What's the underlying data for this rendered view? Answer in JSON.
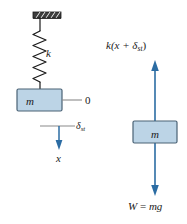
{
  "figure": {
    "type": "physics-free-body-diagram",
    "colors": {
      "block_fill": "#bcd4e6",
      "block_stroke": "#4a6275",
      "arrow_blue": "#2b6ca3",
      "line_black": "#1a1a1a",
      "ceiling_dark": "#3d3d3d",
      "reference_line_gray": "#8a8a8a",
      "background": "#ffffff"
    }
  },
  "left_diagram": {
    "name": "spring-mass-system",
    "ceiling": {
      "label": "fixed-support-hatching"
    },
    "spring": {
      "stiffness_label": "k",
      "coils": 7
    },
    "mass_block": {
      "label": "m"
    },
    "equilibrium_line": {
      "label": "0"
    },
    "static_deflection": {
      "symbol": "δ",
      "subscript": "st"
    },
    "displacement_arrow": {
      "label": "x",
      "direction": "down"
    }
  },
  "right_diagram": {
    "name": "free-body-diagram",
    "mass_block": {
      "label": "m"
    },
    "spring_force": {
      "text_prefix": "k(x + ",
      "symbol": "δ",
      "subscript": "st",
      "text_suffix": ")",
      "direction": "up"
    },
    "weight_force": {
      "prefix": "W",
      "equals": " = ",
      "value": "mg",
      "direction": "down"
    }
  }
}
